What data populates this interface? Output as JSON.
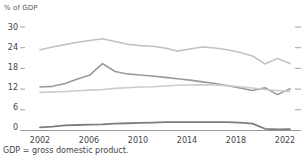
{
  "chart_data": {
    "type": "line",
    "title": "",
    "subtitle": "",
    "ylabel": "% of GDP",
    "xlabel": "",
    "ylim": [
      0,
      30
    ],
    "xlim": [
      2002,
      2022
    ],
    "grid": false,
    "legend_position": "none",
    "y_ticks": [
      30,
      24,
      18,
      12,
      6,
      0
    ],
    "x_ticks": [
      2002,
      2006,
      2010,
      2014,
      2018,
      2022
    ],
    "x": [
      2002,
      2003,
      2004,
      2005,
      2006,
      2007,
      2008,
      2009,
      2010,
      2011,
      2012,
      2013,
      2014,
      2015,
      2016,
      2017,
      2018,
      2019,
      2020,
      2021,
      2022
    ],
    "series": [
      {
        "name": "series-1",
        "color": "#c2c2c2",
        "width": 1.6,
        "values": [
          23.4,
          24.2,
          24.9,
          25.6,
          26.1,
          26.6,
          25.8,
          25.0,
          24.6,
          24.4,
          23.9,
          23.0,
          23.6,
          24.2,
          23.9,
          23.4,
          22.6,
          21.6,
          19.3,
          20.9,
          19.4
        ]
      },
      {
        "name": "series-2",
        "color": "#9a9a9a",
        "width": 1.6,
        "values": [
          12.6,
          12.8,
          13.6,
          14.9,
          16.1,
          19.4,
          17.1,
          16.4,
          16.1,
          15.8,
          15.4,
          15.0,
          14.6,
          14.1,
          13.6,
          13.0,
          12.3,
          11.6,
          12.4,
          10.4,
          12.1
        ]
      },
      {
        "name": "series-3",
        "color": "#cccccc",
        "width": 1.6,
        "values": [
          11.0,
          11.2,
          11.3,
          11.5,
          11.7,
          11.9,
          12.2,
          12.4,
          12.6,
          12.7,
          12.9,
          13.1,
          13.2,
          13.3,
          13.2,
          13.0,
          12.7,
          12.3,
          11.9,
          11.6,
          11.3
        ]
      },
      {
        "name": "series-4",
        "color": "#7d7d7d",
        "width": 1.8,
        "values": [
          0.9,
          1.1,
          1.5,
          1.6,
          1.7,
          1.8,
          2.0,
          2.1,
          2.2,
          2.3,
          2.4,
          2.4,
          2.4,
          2.4,
          2.4,
          2.4,
          2.3,
          2.0,
          0.5,
          0.3,
          0.4
        ]
      }
    ],
    "notes": "GDP = gross domestic product."
  },
  "axis": {
    "y_axis_title": "% of GDP",
    "y_tick_labels": [
      "30",
      "24",
      "18",
      "12",
      "6",
      "0"
    ],
    "x_tick_labels": [
      "2002",
      "2006",
      "2010",
      "2014",
      "2018",
      "2022"
    ]
  },
  "footnote": {
    "text": "GDP = gross domestic product."
  },
  "colors": {
    "axis_line": "#9a9a9a",
    "tick": "#9a9a9a",
    "text": "#3f4447",
    "axis_title_text": "#55595c",
    "background": "#ffffff"
  }
}
